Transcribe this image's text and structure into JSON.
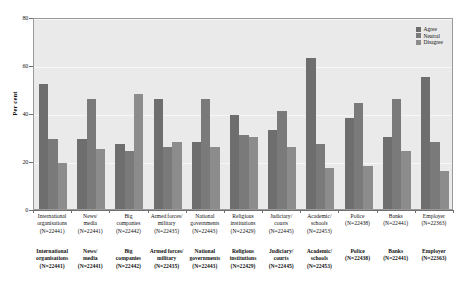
{
  "chart_data": {
    "type": "bar",
    "title": "",
    "xlabel": "",
    "ylabel": "Per cent",
    "ylim": [
      0,
      80
    ],
    "yticks": [
      0,
      20,
      40,
      60,
      80
    ],
    "grid": true,
    "legend_position": "top-right",
    "categories": [
      "International organisations",
      "News/ media",
      "Big companies",
      "Armed forces/ military",
      "National governments",
      "Religious institutions",
      "Judiciary/ courts",
      "Academic/ schools",
      "Police",
      "Banks",
      "Employer"
    ],
    "category_lines": [
      [
        "International",
        "organisations",
        "(N=22441)"
      ],
      [
        "News/",
        "media",
        "(N=22441)"
      ],
      [
        "Big",
        "companies",
        "(N=22442)"
      ],
      [
        "Armed forces/",
        "military",
        "(N=22435)"
      ],
      [
        "National",
        "governments",
        "(N=22443)"
      ],
      [
        "Religious",
        "institutions",
        "(N=22429)"
      ],
      [
        "Judiciary/",
        "courts",
        "(N=22445)"
      ],
      [
        "Academic/",
        "schools",
        "(N=22453)"
      ],
      [
        "Police",
        "(N=22438)",
        ""
      ],
      [
        "Banks",
        "(N=22441)",
        ""
      ],
      [
        "Employer",
        "(N=22363)",
        ""
      ]
    ],
    "sample_sizes": [
      22441,
      22441,
      22442,
      22435,
      22443,
      22429,
      22445,
      22453,
      22438,
      22441,
      22363
    ],
    "series": [
      {
        "name": "Agree",
        "values": [
          52,
          29,
          27,
          46,
          28,
          39,
          33,
          63,
          38,
          30,
          55
        ]
      },
      {
        "name": "Neutral",
        "values": [
          29,
          46,
          24,
          26,
          46,
          31,
          41,
          27,
          44,
          46,
          28
        ]
      },
      {
        "name": "Disagree",
        "values": [
          19,
          25,
          48,
          28,
          26,
          30,
          26,
          17,
          18,
          24,
          16
        ]
      }
    ]
  },
  "legend": {
    "items": [
      {
        "label": "Agree",
        "color": "#6e6e6e"
      },
      {
        "label": "Neutral",
        "color": "#7a7a7a"
      },
      {
        "label": "Disagree",
        "color": "#8c8c8c"
      }
    ]
  },
  "axis": {
    "y_title": "Per cent",
    "y_ticks": [
      "0",
      "20",
      "40",
      "60",
      "80"
    ]
  }
}
